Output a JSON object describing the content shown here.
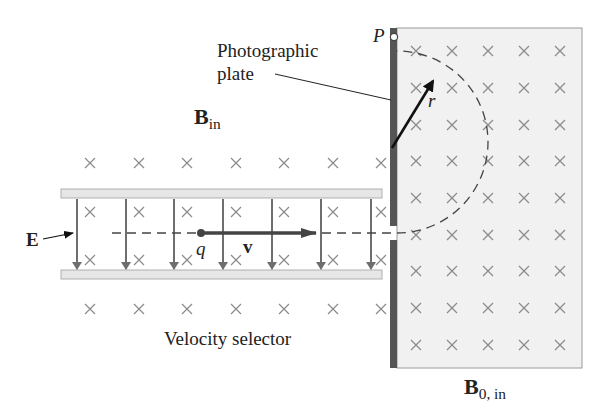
{
  "labels": {
    "photographic_plate_line1": "Photographic",
    "photographic_plate_line2": "plate",
    "b_in_main": "B",
    "b_in_sub": "in",
    "b0_main": "B",
    "b0_sub": "0, in",
    "point_p": "P",
    "radius_r": "r",
    "charge_q": "q",
    "velocity_v": "v",
    "field_e": "E",
    "velocity_selector": "Velocity selector"
  },
  "colors": {
    "plate_strip": "#555555",
    "region_fill": "#f1f1f1",
    "region_border": "#9a9a9a",
    "cross_marks": "#8a8a8a",
    "e_field_arrows": "#6e6e6e",
    "capacitor_plates": "#e6e6e6",
    "text": "#222222"
  },
  "grid": {
    "left_cols": [
      90,
      139,
      187,
      236,
      284,
      333,
      381
    ],
    "left_rows": [
      163,
      212,
      260,
      309
    ],
    "right_cols": [
      416,
      452,
      488,
      524,
      560
    ],
    "right_rows": [
      51,
      88,
      125,
      161,
      198,
      235,
      271,
      308,
      345
    ],
    "e_arrow_x": [
      77,
      126,
      174,
      223,
      272,
      321,
      371
    ]
  }
}
